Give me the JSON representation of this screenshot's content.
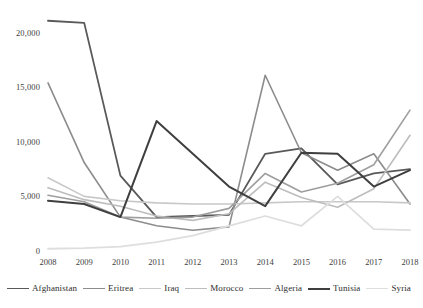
{
  "chart_data": {
    "type": "line",
    "title": "",
    "xlabel": "",
    "ylabel": "",
    "categories": [
      "2008",
      "2009",
      "2010",
      "2011",
      "2012",
      "2013",
      "2014",
      "2015",
      "2016",
      "2017",
      "2018"
    ],
    "ylim": [
      0,
      22000
    ],
    "ytick_labels": [
      "0",
      "5,000",
      "10,000",
      "15,000",
      "20,000"
    ],
    "ytick_values": [
      0,
      5000,
      10000,
      15000,
      20000
    ],
    "grid": false,
    "legend_position": "bottom",
    "series": [
      {
        "name": "Afghanistan",
        "color": "#595959",
        "width": 1.8,
        "values": [
          21200,
          21000,
          7000,
          3200,
          3300,
          3400,
          9000,
          9500,
          6200,
          7200,
          7600
        ]
      },
      {
        "name": "Eritrea",
        "color": "#8c8c8c",
        "width": 1.6,
        "values": [
          15500,
          8200,
          3200,
          2400,
          2000,
          2300,
          16200,
          9100,
          7500,
          9000,
          4400
        ]
      },
      {
        "name": "Iraq",
        "color": "#c8c8c8",
        "width": 1.6,
        "values": [
          6800,
          5100,
          4700,
          4500,
          4400,
          4400,
          4500,
          4600,
          4600,
          4600,
          4500
        ]
      },
      {
        "name": "Morocco",
        "color": "#bdbdbd",
        "width": 1.6,
        "values": [
          5900,
          4800,
          4200,
          3300,
          2900,
          3500,
          6400,
          5000,
          4100,
          5800,
          10700
        ]
      },
      {
        "name": "Algeria",
        "color": "#9e9e9e",
        "width": 1.6,
        "values": [
          5200,
          4600,
          3200,
          3100,
          3200,
          4000,
          7200,
          5500,
          6300,
          8000,
          13000
        ]
      },
      {
        "name": "Tunisia",
        "color": "#3f3f3f",
        "width": 2.0,
        "values": [
          4700,
          4400,
          3200,
          12000,
          9000,
          6000,
          4200,
          9100,
          9000,
          6000,
          7500
        ]
      },
      {
        "name": "Syria",
        "color": "#dedede",
        "width": 1.8,
        "values": [
          300,
          350,
          500,
          900,
          1500,
          2400,
          3300,
          2400,
          5100,
          2100,
          2000
        ]
      }
    ]
  }
}
